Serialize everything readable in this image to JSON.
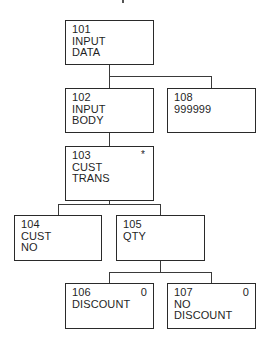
{
  "diagram": {
    "type": "hierarchy-chart",
    "nodes": [
      {
        "id": "101",
        "lines": [
          "101",
          "INPUT",
          "DATA"
        ],
        "flag": "",
        "box": {
          "x": 65,
          "y": 20,
          "w": 89,
          "h": 45
        }
      },
      {
        "id": "102",
        "lines": [
          "102",
          "INPUT",
          "BODY"
        ],
        "flag": "",
        "box": {
          "x": 65,
          "y": 88,
          "w": 89,
          "h": 45
        }
      },
      {
        "id": "108",
        "lines": [
          "108",
          "999999"
        ],
        "flag": "",
        "box": {
          "x": 167,
          "y": 88,
          "w": 89,
          "h": 45
        }
      },
      {
        "id": "103",
        "lines": [
          "103",
          "CUST",
          "TRANS"
        ],
        "flag": "*",
        "box": {
          "x": 65,
          "y": 146,
          "w": 89,
          "h": 55
        }
      },
      {
        "id": "104",
        "lines": [
          "104",
          "CUST",
          "NO"
        ],
        "flag": "",
        "box": {
          "x": 14,
          "y": 215,
          "w": 88,
          "h": 46
        }
      },
      {
        "id": "105",
        "lines": [
          "105",
          "QTY"
        ],
        "flag": "",
        "box": {
          "x": 116,
          "y": 215,
          "w": 89,
          "h": 46
        }
      },
      {
        "id": "106",
        "lines": [
          "106",
          "DISCOUNT"
        ],
        "flag": "0",
        "box": {
          "x": 65,
          "y": 283,
          "w": 89,
          "h": 46
        }
      },
      {
        "id": "107",
        "lines": [
          "107",
          "NO",
          "DISCOUNT"
        ],
        "flag": "0",
        "box": {
          "x": 167,
          "y": 283,
          "w": 89,
          "h": 46
        }
      }
    ],
    "edges": [
      {
        "from": "101",
        "to": "102"
      },
      {
        "from": "101",
        "to": "108"
      },
      {
        "from": "102",
        "to": "103"
      },
      {
        "from": "103",
        "to": "104"
      },
      {
        "from": "103",
        "to": "105"
      },
      {
        "from": "105",
        "to": "106"
      },
      {
        "from": "105",
        "to": "107"
      }
    ]
  },
  "n101": {
    "l0": "101",
    "l1": "INPUT",
    "l2": "DATA"
  },
  "n102": {
    "l0": "102",
    "l1": "INPUT",
    "l2": "BODY"
  },
  "n108": {
    "l0": "108",
    "l1": "999999"
  },
  "n103": {
    "l0": "103",
    "l1": "CUST",
    "l2": "TRANS",
    "flag": "*"
  },
  "n104": {
    "l0": "104",
    "l1": "CUST",
    "l2": "NO"
  },
  "n105": {
    "l0": "105",
    "l1": "QTY"
  },
  "n106": {
    "l0": "106",
    "l1": "DISCOUNT",
    "flag": "0"
  },
  "n107": {
    "l0": "107",
    "l1": "NO",
    "l2": "DISCOUNT",
    "flag": "0"
  }
}
